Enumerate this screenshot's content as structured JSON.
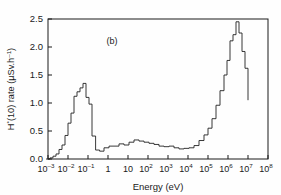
{
  "chart_data": {
    "type": "line",
    "subtype": "step-histogram",
    "title": "",
    "panel_label": "(b)",
    "xlabel": "Energy (eV)",
    "ylabel": "H*(10) rate (µSv.h⁻¹)",
    "ylabel_parts": {
      "prefix": "H",
      "sup1": "*",
      "mid": "(10) rate (µSv.h",
      "sup2": "–1",
      "suffix": ")"
    },
    "x_scale": "log10",
    "y_scale": "linear",
    "xlim": [
      -3,
      8
    ],
    "ylim": [
      0,
      2.5
    ],
    "grid": false,
    "legend": null,
    "x_tick_exponents": [
      -3,
      -2,
      -1,
      0,
      1,
      2,
      3,
      4,
      5,
      6,
      7,
      8
    ],
    "x_tick_labels": [
      "10⁻³",
      "10⁻²",
      "10⁻¹",
      "1",
      "10",
      "10²",
      "10³",
      "10⁴",
      "10⁵",
      "10⁶",
      "10⁷",
      "10⁸"
    ],
    "x_tick_label_base": [
      "10",
      "10",
      "10",
      "1",
      "10",
      "10",
      "10",
      "10",
      "10",
      "10",
      "10",
      "10"
    ],
    "x_tick_label_exp": [
      "–3",
      "–2",
      "–1",
      "",
      "",
      "2",
      "3",
      "4",
      "5",
      "6",
      "7",
      "8"
    ],
    "y_ticks": [
      0.0,
      0.5,
      1.0,
      1.5,
      2.0,
      2.5
    ],
    "y_tick_labels": [
      "0.0",
      "0.5",
      "1.0",
      "1.5",
      "2.0",
      "2.5"
    ],
    "line_color": "#222222",
    "line_width": 0.9,
    "bin_edges_log10": [
      -3.1,
      -2.9,
      -2.75,
      -2.6,
      -2.45,
      -2.3,
      -2.15,
      -2.0,
      -1.85,
      -1.7,
      -1.55,
      -1.4,
      -1.25,
      -1.1,
      -0.95,
      -0.8,
      -0.62,
      -0.42,
      -0.2,
      0.05,
      0.3,
      0.55,
      0.8,
      1.05,
      1.3,
      1.55,
      1.8,
      2.05,
      2.3,
      2.55,
      2.8,
      3.05,
      3.3,
      3.55,
      3.8,
      4.05,
      4.3,
      4.55,
      4.8,
      5.0,
      5.2,
      5.4,
      5.6,
      5.8,
      5.95,
      6.1,
      6.25,
      6.4,
      6.55,
      6.7,
      6.85,
      7.0
    ],
    "bin_values": [
      0.0,
      0.02,
      0.05,
      0.09,
      0.17,
      0.25,
      0.42,
      0.64,
      0.82,
      1.12,
      1.2,
      1.27,
      1.35,
      1.1,
      0.98,
      0.41,
      0.16,
      0.14,
      0.2,
      0.23,
      0.23,
      0.27,
      0.25,
      0.3,
      0.34,
      0.32,
      0.3,
      0.28,
      0.26,
      0.23,
      0.22,
      0.23,
      0.2,
      0.18,
      0.19,
      0.2,
      0.24,
      0.33,
      0.43,
      0.55,
      0.72,
      0.96,
      1.22,
      1.5,
      1.76,
      2.11,
      2.22,
      2.45,
      2.25,
      1.92,
      1.62,
      1.05,
      0.55,
      0.0
    ],
    "annotations": [
      {
        "text": "(b)",
        "x_log10": 0.2,
        "y": 2.05
      }
    ],
    "key_features": {
      "thermal_peak": {
        "energy_eV": 0.05,
        "value": 1.35
      },
      "epithermal_plateau": {
        "energy_range_eV": [
          1,
          10000
        ],
        "value_range": [
          0.15,
          0.34
        ]
      },
      "fast_peak": {
        "energy_eV": 1500000,
        "value": 2.45
      },
      "upper_cutoff_eV": 10000000
    }
  },
  "figure": {
    "background": "#ffffff",
    "frame_color": "#1a1a1a"
  }
}
